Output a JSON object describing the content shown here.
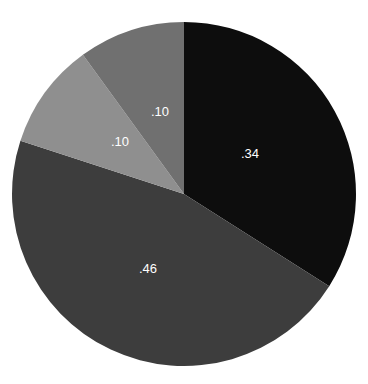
{
  "chart_data": {
    "type": "pie",
    "title": "",
    "title_truncated": true,
    "xlabel": "",
    "ylabel": "",
    "legend": "none",
    "grid": false,
    "start_angle_deg": 0,
    "direction": "clockwise",
    "total": 1.0,
    "label_format": ".NN",
    "background_color": "#ffffff",
    "categories": [
      "Slice 1",
      "Slice 2",
      "Slice 3",
      "Slice 4"
    ],
    "values": [
      0.34,
      0.46,
      0.1,
      0.1
    ],
    "labels": [
      ".34",
      ".46",
      ".10",
      ".10"
    ],
    "colors": [
      "#0d0d0d",
      "#3d3d3d",
      "#8f8f8f",
      "#707070"
    ],
    "label_color": "#ffffff",
    "slices": [
      {
        "label": ".34",
        "value": 0.34,
        "color": "#0d0d0d",
        "start_deg": 0,
        "end_deg": 122.4,
        "label_x": 66,
        "label_y": -39
      },
      {
        "label": ".46",
        "value": 0.46,
        "color": "#3d3d3d",
        "start_deg": 122.4,
        "end_deg": 288.0,
        "label_x": -36,
        "label_y": 76
      },
      {
        "label": ".10",
        "value": 0.1,
        "color": "#8f8f8f",
        "start_deg": 288.0,
        "end_deg": 324.0,
        "label_x": -64,
        "label_y": -51
      },
      {
        "label": ".10",
        "value": 0.1,
        "color": "#707070",
        "start_deg": 324.0,
        "end_deg": 360.0,
        "label_x": -24,
        "label_y": -81
      }
    ],
    "geometry": {
      "center_x": 172,
      "center_y": 172,
      "radius": 172
    }
  }
}
